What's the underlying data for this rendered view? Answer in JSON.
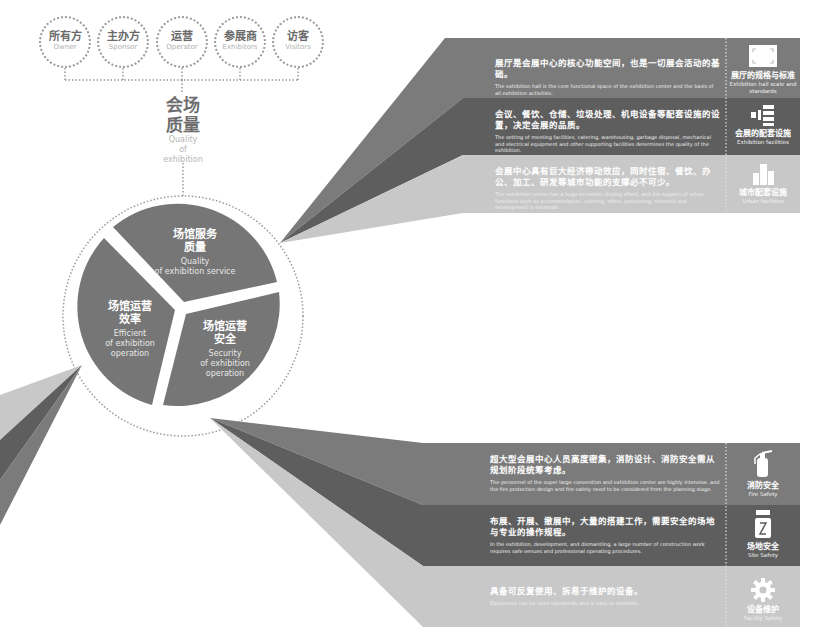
{
  "stakeholders": [
    {
      "cn": "所有方",
      "en": "Owner"
    },
    {
      "cn": "主办方",
      "en": "Sponsor"
    },
    {
      "cn": "运营",
      "en": "Operator"
    },
    {
      "cn": "参展商",
      "en": "Exhibitors"
    },
    {
      "cn": "访客",
      "en": "Visitors"
    }
  ],
  "center": {
    "cn_line1": "会场",
    "cn_line2": "质量",
    "en_line1": "Quality",
    "en_line2": "of",
    "en_line3": "exhibition"
  },
  "pie": {
    "service": {
      "cn_line1": "场馆服务",
      "cn_line2": "质量",
      "en_line1": "Quality",
      "en_line2": "of exhibition service"
    },
    "efficiency": {
      "cn_line1": "场馆运营",
      "cn_line2": "效率",
      "en_line1": "Efficient",
      "en_line2": "of exhibition",
      "en_line3": "operation"
    },
    "security": {
      "cn_line1": "场馆运营",
      "cn_line2": "安全",
      "en_line1": "Security",
      "en_line2": "of exhibition",
      "en_line3": "operation"
    }
  },
  "service_bands": [
    {
      "cn": "展厅是会展中心的核心功能空间，也是一切展会活动的基础。",
      "en": "The exhibition hall is the core functional space of the exhibition center and the basis of all exhibition activities.",
      "tag_cn": "展厅的规格与标准",
      "tag_en": "Exhibition hall scale and standards",
      "icon": "hall-frame-icon",
      "color": "#7b7b7b"
    },
    {
      "cn": "会议、餐饮、仓储、垃圾处理、机电设备等配套设施的设置，决定会展的品质。",
      "en": "The setting of meeting facilities, catering, warehousing, garbage disposal, mechanical and electrical equipment and other supporting facilities determines the quality of the exhibition.",
      "tag_cn": "会展的配套设施",
      "tag_en": "Exhibition facilities",
      "icon": "facilities-list-icon",
      "color": "#5e5e5e"
    },
    {
      "cn": "会展中心具有巨大经济带动效应，同时住宿、餐饮、办公、加工、研发等城市功能的支撑必不可少。",
      "en": "The exhibition center has a huge economic driving effect, and the support of urban functions such as accommodation, catering, office, processing, research and development is essential.",
      "tag_cn": "城市配套设施",
      "tag_en": "Urban facilities",
      "icon": "city-buildings-icon",
      "color": "#c8c8c8"
    }
  ],
  "security_bands": [
    {
      "cn": "超大型会展中心人员高度密集，消防设计、消防安全需从规划阶段统筹考虑。",
      "en": "The personnel of the super large convention and exhibition center are highly intensive, and the fire protection design and fire safety need to be considered from the planning stage.",
      "tag_cn": "消防安全",
      "tag_en": "Fire Safety",
      "icon": "fire-extinguisher-icon",
      "color": "#7b7b7b"
    },
    {
      "cn": "布展、开展、撤展中，大量的搭建工作，需要安全的场地与专业的操作规程。",
      "en": "In the exhibition, development, and dismantling, a large number of construction work requires safe venues and professional operating procedures.",
      "tag_cn": "场地安全",
      "tag_en": "Site Safety",
      "icon": "crane-hook-icon",
      "color": "#5e5e5e"
    },
    {
      "cn": "具备可反复使用、拆易于维护的设备。",
      "en": "Equipment can be used repeatedly and is easy to maintain.",
      "tag_cn": "设备维护",
      "tag_en": "Facility Safety",
      "icon": "gear-icon",
      "color": "#c8c8c8"
    }
  ],
  "colors": {
    "dark": "#5e5e5e",
    "mid": "#7b7b7b",
    "light": "#c8c8c8",
    "pie": "#767676",
    "dots": "#9a9a9a"
  }
}
